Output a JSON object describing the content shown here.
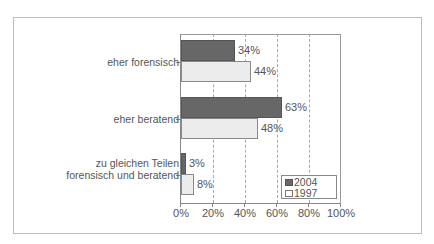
{
  "chart_data": {
    "type": "bar",
    "orientation": "horizontal",
    "title": "",
    "xlabel": "",
    "ylabel": "",
    "xlim": [
      0,
      100
    ],
    "x_ticks": [
      "0%",
      "20%",
      "40%",
      "60%",
      "80%",
      "100%"
    ],
    "grid": "vertical dashed",
    "legend_position": "lower right inside plot",
    "categories": [
      "eher forensisch",
      "eher beratend",
      "zu gleichen Teilen forensisch und beratend"
    ],
    "category_lines": [
      [
        "eher forensisch"
      ],
      [
        "eher beratend"
      ],
      [
        "zu gleichen Teilen",
        "forensisch und beratend"
      ]
    ],
    "series": [
      {
        "name": "2004",
        "color": "#676767",
        "values": [
          34,
          63,
          3
        ],
        "labels": [
          "34%",
          "63%",
          "3%"
        ]
      },
      {
        "name": "1997",
        "color": "#ececec",
        "values": [
          44,
          48,
          8
        ],
        "labels": [
          "44%",
          "48%",
          "8%"
        ]
      }
    ]
  }
}
